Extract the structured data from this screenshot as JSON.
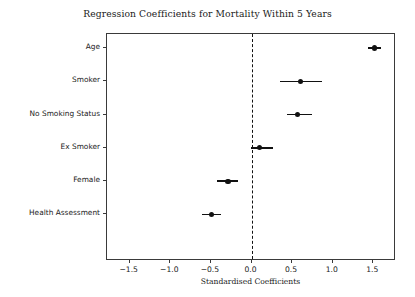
{
  "chart_data": {
    "type": "scatter",
    "title": "Regression Coefficients for Mortality Within 5 Years",
    "xlabel": "Standardised Coefficients",
    "ylabel": "",
    "xlim": [
      -1.78,
      1.78
    ],
    "xticks": [
      -1.5,
      -1.0,
      -0.5,
      0.0,
      0.5,
      1.0,
      1.5
    ],
    "xtick_labels": [
      "−1.5",
      "−1.0",
      "−0.5",
      "0.0",
      "0.5",
      "1.0",
      "1.5"
    ],
    "categories": [
      "Age",
      "Smoker",
      "No Smoking Status",
      "Ex Smoker",
      "Female",
      "Health Assessment"
    ],
    "grid": false,
    "legend": null,
    "reference_line": {
      "value": 0.0,
      "style": "dashed",
      "color": "#111111"
    },
    "marker_color": "#111111",
    "errorbar_color": "#111111",
    "points": [
      {
        "label": "Age",
        "value": 1.52,
        "ci_low": 1.43,
        "ci_high": 1.6
      },
      {
        "label": "Smoker",
        "value": 0.6,
        "ci_low": 0.35,
        "ci_high": 0.87
      },
      {
        "label": "No Smoking Status",
        "value": 0.57,
        "ci_low": 0.44,
        "ci_high": 0.74
      },
      {
        "label": "Ex Smoker",
        "value": 0.1,
        "ci_low": -0.01,
        "ci_high": 0.26
      },
      {
        "label": "Female",
        "value": -0.29,
        "ci_low": -0.42,
        "ci_high": -0.17
      },
      {
        "label": "Health Assessment",
        "value": -0.49,
        "ci_low": -0.61,
        "ci_high": -0.37
      }
    ]
  }
}
